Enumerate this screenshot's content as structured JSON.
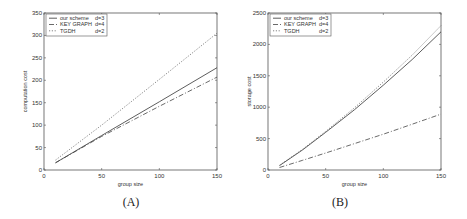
{
  "chart_data": [
    {
      "type": "line",
      "panel": "A",
      "caption": "(A)",
      "title": "",
      "xlabel": "group size",
      "ylabel": "computation cost",
      "xlim": [
        0,
        150
      ],
      "ylim": [
        0,
        350
      ],
      "xticks": [
        0,
        50,
        100,
        150
      ],
      "yticks": [
        0,
        50,
        100,
        150,
        200,
        250,
        300,
        350
      ],
      "grid": false,
      "legend_position": "upper left",
      "x": [
        10,
        50,
        100,
        150
      ],
      "series": [
        {
          "name": "our scheme",
          "param": "d=3",
          "style": "solid",
          "values": [
            16,
            77,
            152,
            228
          ]
        },
        {
          "name": "KEY GRAPH",
          "param": "d=4",
          "style": "dashdot",
          "values": [
            16,
            75,
            142,
            207
          ]
        },
        {
          "name": "TGDH",
          "param": "d=2",
          "style": "dotted",
          "values": [
            22,
            100,
            202,
            305
          ]
        }
      ]
    },
    {
      "type": "line",
      "panel": "B",
      "caption": "(B)",
      "title": "",
      "xlabel": "group size",
      "ylabel": "storage cost",
      "xlim": [
        0,
        150
      ],
      "ylim": [
        0,
        2500
      ],
      "xticks": [
        0,
        50,
        100,
        150
      ],
      "yticks": [
        0,
        500,
        1000,
        1500,
        2000,
        2500
      ],
      "grid": false,
      "legend_position": "upper left",
      "x": [
        10,
        30,
        50,
        75,
        100,
        125,
        150
      ],
      "series": [
        {
          "name": "our scheme",
          "param": "d=3",
          "style": "solid",
          "values": [
            70,
            320,
            600,
            960,
            1350,
            1760,
            2200
          ]
        },
        {
          "name": "KEY GRAPH",
          "param": "d=4",
          "style": "dashdot",
          "values": [
            40,
            155,
            270,
            420,
            570,
            730,
            890
          ]
        },
        {
          "name": "TGDH",
          "param": "d=2",
          "style": "dotted",
          "values": [
            75,
            330,
            615,
            990,
            1400,
            1830,
            2300
          ]
        }
      ]
    }
  ]
}
